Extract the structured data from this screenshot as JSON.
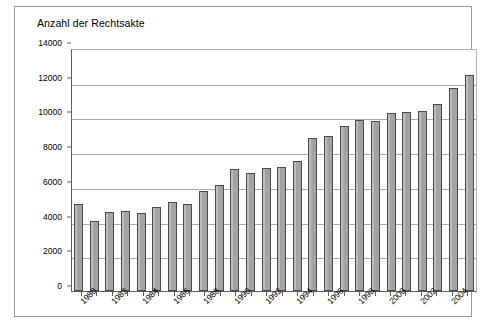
{
  "chart_data": {
    "type": "bar",
    "title": "Anzahl der Rechtsakte",
    "xlabel": "",
    "ylabel": "",
    "ylim": [
      0,
      14000
    ],
    "ytick_labels": [
      "14000",
      "12000",
      "10000",
      "8000",
      "6000",
      "4000",
      "2000",
      "0"
    ],
    "ytick_values": [
      14000,
      12000,
      10000,
      8000,
      6000,
      4000,
      2000,
      0
    ],
    "grid": true,
    "legend": false,
    "xtick_labels": [
      "1980",
      "1982",
      "1984",
      "1986",
      "1988",
      "1990",
      "1992",
      "1994",
      "1996",
      "1998",
      "2000",
      "2002",
      "2004"
    ],
    "categories": [
      "1980",
      "1981",
      "1982",
      "1983",
      "1984",
      "1985",
      "1986",
      "1987",
      "1988",
      "1989",
      "1990",
      "1991",
      "1992",
      "1993",
      "1994",
      "1995",
      "1996",
      "1997",
      "1998",
      "1999",
      "2000",
      "2001",
      "2002",
      "2003",
      "2004",
      "2005"
    ],
    "values": [
      5000,
      4050,
      4550,
      4600,
      4500,
      4850,
      5150,
      5000,
      5750,
      6100,
      7050,
      6800,
      7100,
      7150,
      7500,
      8800,
      8950,
      9500,
      9850,
      9800,
      10250,
      10300,
      10400,
      10750,
      11700,
      12450
    ],
    "bar_color": "#a3a3a3",
    "bar_border_color": "#4a4a4a",
    "grid_color": "#a9a9a9",
    "axis_color": "#5d5d5d",
    "frame_color": "#9a9a9a",
    "background": "#ffffff"
  }
}
